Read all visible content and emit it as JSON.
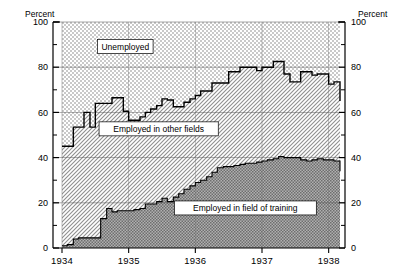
{
  "chart_data": {
    "type": "area",
    "title": "",
    "subtitle": "",
    "xlabel": "",
    "ylabel": "Percent",
    "ylabel_right": "Percent",
    "ylim": [
      0,
      100
    ],
    "yticks": [
      0,
      20,
      40,
      60,
      80,
      100
    ],
    "ytick_labels": [
      "0",
      "20",
      "40",
      "60",
      "80",
      "100"
    ],
    "yminor_ticks": [
      10,
      30,
      50,
      70,
      90
    ],
    "xlim": [
      1933.75,
      1938.35
    ],
    "xticks": [
      1934,
      1935,
      1936,
      1937,
      1938
    ],
    "xtick_labels": [
      "1934",
      "1935",
      "1936",
      "1937",
      "1938"
    ],
    "grid": true,
    "legend_position": "inline-annotations",
    "stacked": true,
    "annotations": [
      {
        "text": "Unemployed",
        "x": 1934.95,
        "y": 89,
        "boxed": true
      },
      {
        "text": "Employed in other fields",
        "x": 1935.45,
        "y": 52.5,
        "boxed": true
      },
      {
        "text": "Employed in field of training",
        "x": 1936.75,
        "y": 17.5,
        "boxed": true
      }
    ],
    "series": [
      {
        "name": "Employed in field of training",
        "order": 1,
        "fill": "#9a9a9a",
        "x": [
          1934.0,
          1934.08,
          1934.17,
          1934.25,
          1934.33,
          1934.42,
          1934.5,
          1934.58,
          1934.67,
          1934.75,
          1934.83,
          1934.92,
          1935.0,
          1935.08,
          1935.17,
          1935.25,
          1935.33,
          1935.42,
          1935.5,
          1935.58,
          1935.67,
          1935.75,
          1935.83,
          1935.92,
          1936.0,
          1936.08,
          1936.17,
          1936.25,
          1936.33,
          1936.42,
          1936.5,
          1936.58,
          1936.67,
          1936.75,
          1936.83,
          1936.92,
          1937.0,
          1937.08,
          1937.17,
          1937.25,
          1937.33,
          1937.42,
          1937.5,
          1937.58,
          1937.67,
          1937.75,
          1937.83,
          1937.92,
          1938.0,
          1938.08,
          1938.17
        ],
        "values": [
          1.0,
          1.5,
          4.0,
          4.5,
          4.5,
          4.5,
          4.5,
          13.0,
          17.5,
          16.0,
          16.5,
          16.5,
          16.5,
          17.0,
          17.5,
          19.5,
          19.5,
          20.5,
          22.0,
          20.5,
          22.5,
          24.0,
          26.0,
          27.5,
          29.0,
          30.0,
          31.5,
          33.5,
          35.5,
          36.0,
          36.0,
          36.5,
          37.0,
          37.5,
          37.5,
          38.0,
          38.5,
          39.0,
          39.5,
          40.5,
          40.0,
          40.0,
          40.0,
          39.0,
          38.5,
          39.0,
          39.5,
          39.0,
          39.0,
          38.5,
          34.0
        ]
      },
      {
        "name": "Employed in other fields",
        "order": 2,
        "fill": "#c2c2c2",
        "cumulative_top_is": "unemployed_boundary"
      },
      {
        "name": "Unemployed",
        "order": 3,
        "fill": "#dcdcdc",
        "boundary_note": "top of Employed-in-other-fields band; area above is Unemployed",
        "x": [
          1934.0,
          1934.08,
          1934.17,
          1934.25,
          1934.33,
          1934.42,
          1934.5,
          1934.58,
          1934.67,
          1934.75,
          1934.83,
          1934.92,
          1935.0,
          1935.08,
          1935.17,
          1935.25,
          1935.33,
          1935.42,
          1935.5,
          1935.58,
          1935.67,
          1935.75,
          1935.83,
          1935.92,
          1936.0,
          1936.08,
          1936.17,
          1936.25,
          1936.33,
          1936.42,
          1936.5,
          1936.58,
          1936.67,
          1936.75,
          1936.83,
          1936.92,
          1937.0,
          1937.08,
          1937.17,
          1937.25,
          1937.33,
          1937.42,
          1937.5,
          1937.58,
          1937.67,
          1937.75,
          1937.83,
          1937.92,
          1938.0,
          1938.08,
          1938.17
        ],
        "values": [
          45.0,
          45.0,
          53.5,
          53.5,
          60.0,
          53.5,
          64.0,
          64.0,
          64.0,
          66.5,
          66.5,
          60.5,
          56.5,
          56.5,
          58.0,
          60.0,
          61.5,
          63.0,
          66.0,
          65.5,
          62.5,
          62.5,
          64.5,
          66.0,
          67.5,
          69.5,
          69.5,
          73.0,
          73.0,
          73.0,
          78.0,
          78.0,
          80.0,
          80.0,
          80.0,
          78.5,
          80.0,
          80.0,
          82.5,
          82.5,
          77.0,
          73.5,
          73.5,
          78.0,
          78.0,
          76.5,
          77.0,
          77.0,
          72.5,
          73.5,
          65.0
        ]
      }
    ]
  },
  "axes": {
    "left_title": "Percent",
    "right_title": "Percent"
  }
}
